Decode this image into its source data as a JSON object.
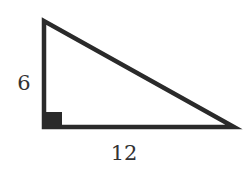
{
  "diagram": {
    "type": "right-triangle",
    "vertices": {
      "top": [
        44,
        21
      ],
      "right_angle": [
        44,
        127
      ],
      "right": [
        234,
        127
      ]
    },
    "stroke_color": "#2a2a2a",
    "labels": {
      "vertical_leg": "6",
      "horizontal_leg": "12"
    },
    "right_angle_marker": true
  }
}
